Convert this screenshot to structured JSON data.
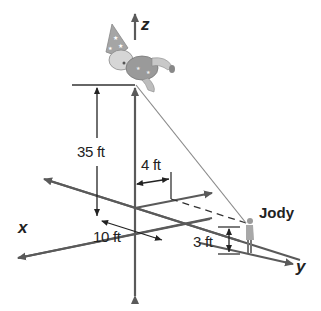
{
  "diagram": {
    "type": "3d-coordinate-word-problem",
    "axes": {
      "x_label": "x",
      "y_label": "y",
      "z_label": "z"
    },
    "measurements": {
      "height": "35 ft",
      "offset_y": "4 ft",
      "offset_x": "10 ft",
      "person_height": "3 ft"
    },
    "person_label": "Jody",
    "objects": {
      "balloon": "clown-balloon",
      "person": "person-figure"
    },
    "colors": {
      "axis": "#5a5a5a",
      "line": "#333333",
      "string": "#8a8a8a",
      "balloon": "#9a9a9a"
    }
  }
}
